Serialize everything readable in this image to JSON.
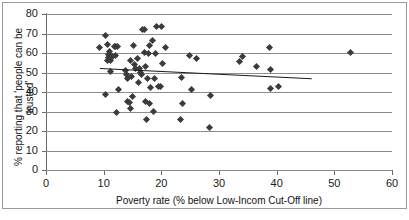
{
  "chart_data": {
    "type": "scatter",
    "title": "",
    "xlabel": "Poverty rate (% below Low-Incom Cut-Off line)",
    "ylabel": "% reporting that 'people can be trusted'",
    "xlim": [
      0,
      60
    ],
    "ylim": [
      0,
      80
    ],
    "xticks": [
      0,
      10,
      20,
      30,
      40,
      50,
      60
    ],
    "yticks": [
      0,
      10,
      20,
      30,
      40,
      50,
      60,
      70,
      80
    ],
    "grid": "horizontal",
    "legend": "none",
    "marker": "diamond",
    "marker_color": "#3b3b3b",
    "trendline": {
      "type": "linear",
      "color": "#1a1a1a",
      "x_start": 9.3,
      "y_start": 52.3,
      "x_end": 46.0,
      "y_end": 47.1
    },
    "points": [
      {
        "x": 9.3,
        "y": 62.7
      },
      {
        "x": 10.3,
        "y": 68.8
      },
      {
        "x": 10.4,
        "y": 38.8
      },
      {
        "x": 10.6,
        "y": 64.2
      },
      {
        "x": 10.7,
        "y": 56.3
      },
      {
        "x": 10.8,
        "y": 59.4
      },
      {
        "x": 10.9,
        "y": 57.6
      },
      {
        "x": 11.0,
        "y": 61.0
      },
      {
        "x": 11.1,
        "y": 56.0
      },
      {
        "x": 11.2,
        "y": 50.4
      },
      {
        "x": 11.4,
        "y": 58.4
      },
      {
        "x": 11.6,
        "y": 58.3
      },
      {
        "x": 11.8,
        "y": 63.5
      },
      {
        "x": 12.0,
        "y": 63.4
      },
      {
        "x": 12.1,
        "y": 58.5
      },
      {
        "x": 12.2,
        "y": 29.5
      },
      {
        "x": 12.4,
        "y": 63.4
      },
      {
        "x": 12.6,
        "y": 41.5
      },
      {
        "x": 13.8,
        "y": 51.0
      },
      {
        "x": 14.0,
        "y": 49.0
      },
      {
        "x": 14.1,
        "y": 35.3
      },
      {
        "x": 14.2,
        "y": 46.9
      },
      {
        "x": 14.4,
        "y": 34.8
      },
      {
        "x": 14.6,
        "y": 56.1
      },
      {
        "x": 14.7,
        "y": 31.7
      },
      {
        "x": 14.8,
        "y": 48.1
      },
      {
        "x": 15.0,
        "y": 37.7
      },
      {
        "x": 15.2,
        "y": 63.6
      },
      {
        "x": 15.4,
        "y": 54.0
      },
      {
        "x": 15.6,
        "y": 52.0
      },
      {
        "x": 15.8,
        "y": 57.3
      },
      {
        "x": 16.0,
        "y": 44.9
      },
      {
        "x": 16.2,
        "y": 51.8
      },
      {
        "x": 16.4,
        "y": 50.0
      },
      {
        "x": 16.6,
        "y": 49.0
      },
      {
        "x": 16.8,
        "y": 72.2
      },
      {
        "x": 17.0,
        "y": 72.3
      },
      {
        "x": 17.1,
        "y": 60.5
      },
      {
        "x": 17.2,
        "y": 35.3
      },
      {
        "x": 17.3,
        "y": 53.0
      },
      {
        "x": 17.4,
        "y": 26.0
      },
      {
        "x": 17.6,
        "y": 47.0
      },
      {
        "x": 17.8,
        "y": 60.0
      },
      {
        "x": 17.9,
        "y": 34.2
      },
      {
        "x": 18.0,
        "y": 64.0
      },
      {
        "x": 18.2,
        "y": 42.2
      },
      {
        "x": 18.4,
        "y": 66.6
      },
      {
        "x": 18.6,
        "y": 29.9
      },
      {
        "x": 18.8,
        "y": 46.7
      },
      {
        "x": 19.0,
        "y": 59.5
      },
      {
        "x": 19.2,
        "y": 73.8
      },
      {
        "x": 19.5,
        "y": 43.0
      },
      {
        "x": 19.8,
        "y": 42.7
      },
      {
        "x": 20.0,
        "y": 73.5
      },
      {
        "x": 20.2,
        "y": 54.8
      },
      {
        "x": 20.8,
        "y": 63.0
      },
      {
        "x": 23.3,
        "y": 25.9
      },
      {
        "x": 23.5,
        "y": 47.5
      },
      {
        "x": 23.6,
        "y": 34.2
      },
      {
        "x": 24.9,
        "y": 58.6
      },
      {
        "x": 25.3,
        "y": 41.2
      },
      {
        "x": 26.1,
        "y": 57.4
      },
      {
        "x": 28.4,
        "y": 21.8
      },
      {
        "x": 28.5,
        "y": 38.1
      },
      {
        "x": 33.5,
        "y": 55.8
      },
      {
        "x": 34.0,
        "y": 58.2
      },
      {
        "x": 36.5,
        "y": 53.2
      },
      {
        "x": 38.8,
        "y": 63.0
      },
      {
        "x": 38.9,
        "y": 51.3
      },
      {
        "x": 38.9,
        "y": 42.0
      },
      {
        "x": 40.4,
        "y": 42.9
      },
      {
        "x": 52.8,
        "y": 60.1
      }
    ]
  },
  "axes": {
    "x_tick_labels": [
      "0",
      "10",
      "20",
      "30",
      "40",
      "50",
      "60"
    ],
    "y_tick_labels": [
      "0",
      "10",
      "20",
      "30",
      "40",
      "50",
      "60",
      "70",
      "80"
    ],
    "x_title": "Poverty rate (% below Low-Incom Cut-Off line)",
    "y_title": "% reporting that 'people can be trusted'"
  }
}
